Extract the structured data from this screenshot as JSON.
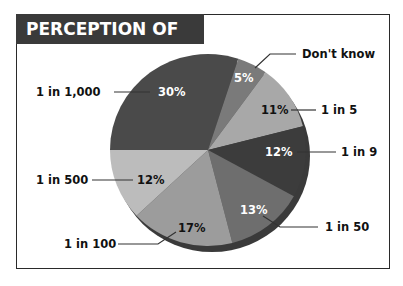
{
  "title": "PERCEPTION OF RISK",
  "chart_data": {
    "type": "pie",
    "title": "PERCEPTION OF RISK",
    "categories": [
      "1 in 1,000",
      "Don't know",
      "1 in 5",
      "1 in 9",
      "1 in 50",
      "1 in 100",
      "1 in 500"
    ],
    "values": [
      30,
      5,
      11,
      12,
      13,
      17,
      12
    ],
    "value_labels": [
      "30%",
      "5%",
      "11%",
      "12%",
      "13%",
      "17%",
      "12%"
    ],
    "colors": [
      "#4a4a4a",
      "#7a7a7a",
      "#a8a8a8",
      "#3c3c3c",
      "#6e6e6e",
      "#9c9c9c",
      "#bcbcbc"
    ],
    "start_angle_deg": 180,
    "direction": "clockwise",
    "legend_position": "callout labels"
  },
  "labels": {
    "s0": {
      "cat": "1 in 1,000",
      "pct": "30%"
    },
    "s1": {
      "cat": "Don't know",
      "pct": "5%"
    },
    "s2": {
      "cat": "1 in 5",
      "pct": "11%"
    },
    "s3": {
      "cat": "1 in 9",
      "pct": "12%"
    },
    "s4": {
      "cat": "1 in 50",
      "pct": "13%"
    },
    "s5": {
      "cat": "1 in 100",
      "pct": "17%"
    },
    "s6": {
      "cat": "1 in 500",
      "pct": "12%"
    }
  }
}
